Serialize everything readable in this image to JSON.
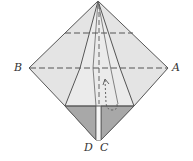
{
  "diagram": {
    "type": "origami-fold-step",
    "labels": {
      "A": "A",
      "B": "B",
      "C": "C",
      "D": "D"
    },
    "colors": {
      "paper_light": "#e6e6e6",
      "paper_mid": "#dcdcdc",
      "paper_shaded": "#a9a9a9",
      "line": "#555555",
      "background": "#ffffff"
    },
    "elements": [
      {
        "kind": "valley-fold-line",
        "description": "horizontal dashed crease B to A"
      },
      {
        "kind": "valley-fold-line",
        "description": "upper horizontal dashed crease"
      },
      {
        "kind": "valley-fold-line",
        "description": "vertical dashed center crease"
      },
      {
        "kind": "arrow",
        "description": "fold-up arrow with hook at bottom"
      },
      {
        "kind": "shaded-flap",
        "description": "bottom-left triangular flap ending at D"
      },
      {
        "kind": "shaded-flap",
        "description": "bottom-right triangular flap ending at C"
      }
    ]
  }
}
